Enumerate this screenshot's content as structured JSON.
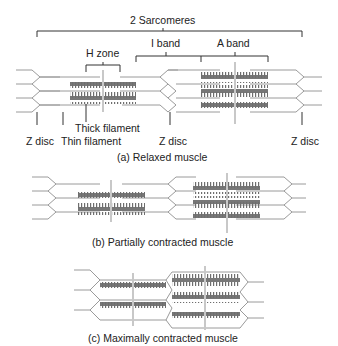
{
  "title": "2 Sarcomeres",
  "labels": {
    "sarcomeres": "2 Sarcomeres",
    "h_zone": "H zone",
    "i_band": "I band",
    "a_band": "A band",
    "thick_filament": "Thick filament",
    "thin_filament": "Thin filament",
    "z_disc_1": "Z disc",
    "z_disc_2": "Z disc",
    "z_disc_3": "Z disc"
  },
  "panels": [
    {
      "id": "a",
      "caption": "(a) Relaxed muscle"
    },
    {
      "id": "b",
      "caption": "(b) Partially contracted muscle"
    },
    {
      "id": "c",
      "caption": "(c) Maximally contracted muscle"
    }
  ],
  "colors": {
    "thick_filament": "#7a7a7a",
    "thin_filament": "#9a9a9a",
    "m_line": "#c8c8c8",
    "bracket": "#333333"
  }
}
